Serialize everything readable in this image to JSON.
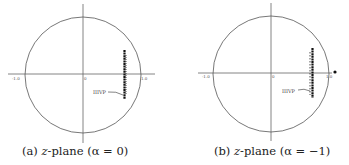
{
  "panels": [
    {
      "id": "a",
      "caption_prefix": "(a) ",
      "caption_var": "z",
      "caption_rest": "-plane  (α = 0)",
      "tick_left": "-1.0",
      "tick_center": "0",
      "tick_right": "1.0",
      "annotation": "IIIVP",
      "has_outside_pole": false
    },
    {
      "id": "b",
      "caption_prefix": "(b) ",
      "caption_var": "z",
      "caption_rest": "-plane (α = −1)",
      "tick_left": "-1.0",
      "tick_center": "0",
      "tick_right": "1.0",
      "annotation": "IIIVP",
      "has_outside_pole": true
    }
  ],
  "colors": {
    "line": "#555555",
    "points": "#111111",
    "text": "#222222"
  }
}
